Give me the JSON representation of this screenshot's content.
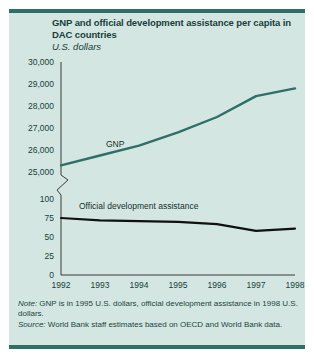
{
  "figure": {
    "title": "GNP and official development assistance per capita in DAC countries",
    "subtitle": "U.S. dollars",
    "note_label": "Note:",
    "note_text": " GNP is in 1995 U.S. dollars, official development assistance in 1998 U.S. dollars.",
    "source_label": "Source:",
    "source_text": " World Bank staff estimates based on OECD and World Bank data."
  },
  "colors": {
    "panel_background": "#d4e6e2",
    "rule": "#2f6f66",
    "gnp_line": "#2e6f68",
    "oda_line": "#101010",
    "axis": "#3b3b3b",
    "text": "#173f3a"
  },
  "chart_data": {
    "type": "line",
    "title": "GNP and official development assistance per capita in DAC countries",
    "subtitle": "U.S. dollars",
    "xlabel": "",
    "ylabel": "U.S. dollars",
    "x": [
      1992,
      1993,
      1994,
      1995,
      1996,
      1997,
      1998
    ],
    "categories": [
      "1992",
      "1993",
      "1994",
      "1995",
      "1996",
      "1997",
      "1998"
    ],
    "broken_axis": true,
    "axis_break_between": [
      25000,
      100
    ],
    "upper_axis": {
      "ticks": [
        "25,000",
        "26,000",
        "27,000",
        "28,000",
        "29,000",
        "30,000"
      ],
      "tick_values": [
        25000,
        26000,
        27000,
        28000,
        29000,
        30000
      ],
      "ylim": [
        25000,
        30000
      ]
    },
    "lower_axis": {
      "ticks": [
        "0",
        "25",
        "50",
        "75",
        "100"
      ],
      "tick_values": [
        0,
        25,
        50,
        75,
        100
      ],
      "ylim": [
        0,
        100
      ]
    },
    "grid": false,
    "legend": "inline-labels",
    "series": [
      {
        "name": "GNP",
        "label": "GNP",
        "axis": "upper",
        "color": "#2e6f68",
        "values": [
          25300,
          25750,
          26200,
          26800,
          27500,
          28450,
          28800
        ]
      },
      {
        "name": "Official development assistance",
        "label": "Official development assistance",
        "axis": "lower",
        "color": "#101010",
        "values": [
          75,
          72,
          71,
          70,
          67,
          58,
          61
        ]
      }
    ]
  }
}
